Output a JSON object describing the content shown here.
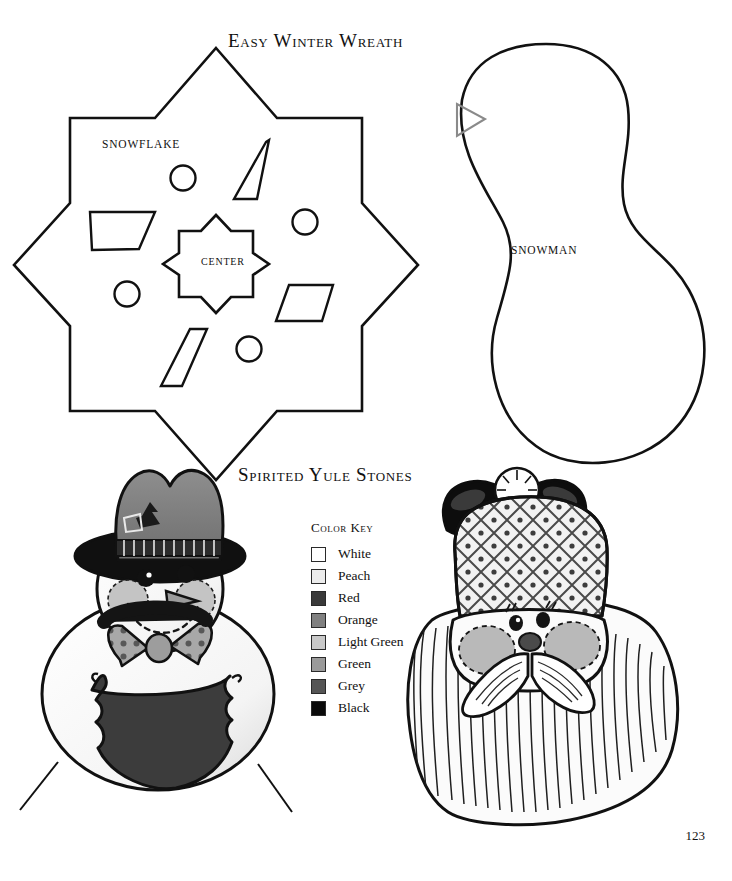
{
  "page": {
    "number": "123",
    "background_color": "#ffffff",
    "ink_color": "#111111"
  },
  "sections": {
    "wreath": {
      "title": "Easy Winter Wreath",
      "patterns": [
        {
          "name": "snowflake",
          "label": "SNOWFLAKE",
          "shape": "eight-point-star-outline"
        },
        {
          "name": "center",
          "label": "CENTER",
          "shape": "small-eight-point-star-outline"
        },
        {
          "name": "snowman",
          "label": "SNOWMAN",
          "shape": "peanut-outline"
        }
      ],
      "cut_pieces": {
        "circles": 4,
        "diamonds": 4
      }
    },
    "stones": {
      "title": "Spirited Yule Stones",
      "figures": [
        {
          "name": "snowman-stone",
          "description": "painted snowman rock with hat, carrot nose and bow tie"
        },
        {
          "name": "santa-stone",
          "description": "painted santa rock with lattice hat, mustache and long beard"
        }
      ]
    }
  },
  "color_key": {
    "title": "Color Key",
    "entries": [
      {
        "label": "White",
        "swatch": "#ffffff"
      },
      {
        "label": "Peach",
        "swatch": "#ececec"
      },
      {
        "label": "Red",
        "swatch": "#3a3a3a"
      },
      {
        "label": "Orange",
        "swatch": "#808080"
      },
      {
        "label": "Light Green",
        "swatch": "#c9c9c9"
      },
      {
        "label": "Green",
        "swatch": "#9a9a9a"
      },
      {
        "label": "Grey",
        "swatch": "#555555"
      },
      {
        "label": "Black",
        "swatch": "#0a0a0a"
      }
    ]
  }
}
